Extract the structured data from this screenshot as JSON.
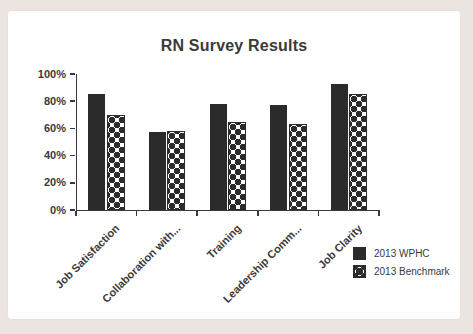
{
  "page": {
    "background_color": "#ebe4e0",
    "card_color": "#fefefe",
    "ink_color": "#2b2b2b"
  },
  "chart_data": {
    "type": "bar",
    "title": "RN Survey Results",
    "categories": [
      "Job Satisfaction",
      "Collaboration with...",
      "Training",
      "Leadership Comm...",
      "Job Clarity"
    ],
    "series": [
      {
        "name": "2013 WPHC",
        "style": "solid",
        "color": "#2b2b2b",
        "values": [
          85,
          57,
          78,
          77,
          93
        ]
      },
      {
        "name": "2013 Benchmark",
        "style": "polka-dot",
        "color": "#2b2b2b",
        "values": [
          70,
          58,
          65,
          63,
          85
        ]
      }
    ],
    "xlabel": "",
    "ylabel": "",
    "ylim": [
      0,
      100
    ],
    "yticks": [
      "0%",
      "20%",
      "40%",
      "60%",
      "80%",
      "100%"
    ],
    "grid": false,
    "legend_position": "bottom-right"
  }
}
